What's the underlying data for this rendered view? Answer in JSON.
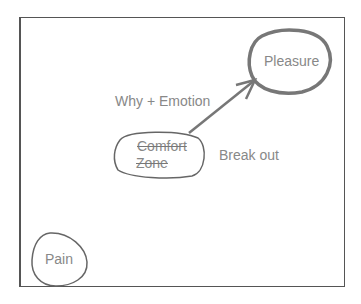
{
  "diagram": {
    "nodes": [
      {
        "id": "pleasure",
        "label": "Pleasure"
      },
      {
        "id": "comfort-zone",
        "label_line1": "Comfort",
        "label_line2": "Zone",
        "struck_through": true
      },
      {
        "id": "pain",
        "label": "Pain"
      }
    ],
    "edges": [
      {
        "from": "comfort-zone",
        "to": "pleasure",
        "label": "Why + Emotion"
      }
    ],
    "annotations": {
      "break_out": "Break out"
    },
    "colors": {
      "stroke": "#777777",
      "text": "#888888",
      "frame": "#555555"
    }
  }
}
